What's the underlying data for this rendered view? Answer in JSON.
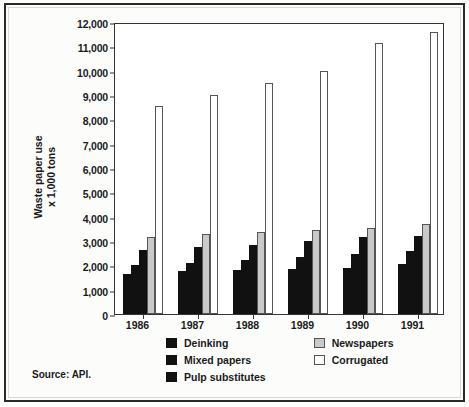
{
  "chart_data": {
    "type": "bar",
    "title": "",
    "xlabel": "",
    "ylabel": "Waste paper use x 1,000 tons",
    "ylabel_line1": "Waste paper use",
    "ylabel_line2": "x 1,000 tons",
    "ylim": [
      0,
      12000
    ],
    "ytick_step": 1000,
    "grid": false,
    "legend_position": "bottom",
    "categories": [
      "1986",
      "1987",
      "1988",
      "1989",
      "1990",
      "1991"
    ],
    "ytick_labels": [
      "12,000",
      "11,000",
      "10,000",
      "9,000",
      "8,000",
      "7,000",
      "6,000",
      "5,000",
      "4,000",
      "3,000",
      "2,000",
      "1,000",
      "0"
    ],
    "ytick_values": [
      12000,
      11000,
      10000,
      9000,
      8000,
      7000,
      6000,
      5000,
      4000,
      3000,
      2000,
      1000,
      0
    ],
    "series": [
      {
        "name": "Deinking",
        "fill": "solid",
        "color": "#111111",
        "values": [
          1650,
          1750,
          1800,
          1850,
          1900,
          2050
        ]
      },
      {
        "name": "Mixed papers",
        "fill": "solid",
        "color": "#111111",
        "values": [
          2000,
          2100,
          2200,
          2350,
          2450,
          2600
        ]
      },
      {
        "name": "Pulp substitutes",
        "fill": "solid",
        "color": "#111111",
        "values": [
          2620,
          2750,
          2850,
          3000,
          3150,
          3200
        ]
      },
      {
        "name": "Newspapers",
        "fill": "gray",
        "color": "#c9c9c9",
        "values": [
          3180,
          3270,
          3380,
          3450,
          3550,
          3700
        ]
      },
      {
        "name": "Corrugated",
        "fill": "open",
        "color": "#ffffff",
        "values": [
          8550,
          9000,
          9500,
          10000,
          11150,
          11600
        ]
      }
    ],
    "source": "Source: API."
  },
  "legend": {
    "column1": [
      {
        "label": "Deinking",
        "fill": "solid"
      },
      {
        "label": "Mixed papers",
        "fill": "solid"
      },
      {
        "label": "Pulp substitutes",
        "fill": "solid"
      }
    ],
    "column2": [
      {
        "label": "Newspapers",
        "fill": "gray"
      },
      {
        "label": "Corrugated",
        "fill": "open"
      }
    ]
  },
  "footer": {
    "source": "Source: API."
  }
}
